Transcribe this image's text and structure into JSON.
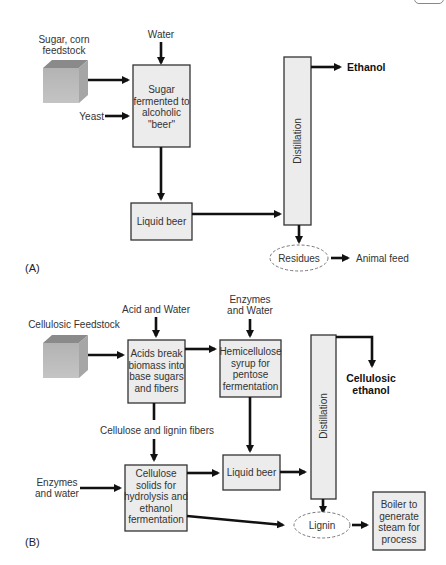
{
  "panel_a": {
    "label": "(A)",
    "feedstock_label_1": "Sugar, corn",
    "feedstock_label_2": "feedstock",
    "water_label": "Water",
    "yeast_label": "Yeast",
    "ferment_box": [
      "Sugar",
      "fermented to",
      "alcoholic",
      "\"beer\""
    ],
    "liquid_beer": "Liquid beer",
    "distillation": "Distillation",
    "ethanol": "Ethanol",
    "residues": "Residues",
    "animal_feed": "Animal feed"
  },
  "panel_b": {
    "label": "(B)",
    "feedstock_label": "Cellulosic Feedstock",
    "acid_water_label": "Acid and Water",
    "acids_box": [
      "Acids break",
      "biomass into",
      "base sugars",
      "and fibers"
    ],
    "enzymes_water_top_1": "Enzymes",
    "enzymes_water_top_2": "and Water",
    "hemi_box": [
      "Hemicellulose",
      "syrup for",
      "pentose",
      "fermentation"
    ],
    "fibers_label": "Cellulose and lignin fibers",
    "enzymes_water_left_1": "Enzymes",
    "enzymes_water_left_2": "and water",
    "cellulose_box": [
      "Cellulose",
      "solids for",
      "hydrolysis and",
      "ethanol",
      "fermentation"
    ],
    "liquid_beer": "Liquid beer",
    "distillation": "Distillation",
    "cellulosic_ethanol_1": "Cellulosic",
    "cellulosic_ethanol_2": "ethanol",
    "lignin": "Lignin",
    "boiler_box": [
      "Boiler to",
      "generate",
      "steam for",
      "process"
    ]
  },
  "colors": {
    "box_fill": "#ececec",
    "stroke": "#333333",
    "arrow": "#111111",
    "cube_front": "#b8b8b8",
    "cube_top": "#8a8a8a",
    "cube_side": "#a6a6a6"
  }
}
